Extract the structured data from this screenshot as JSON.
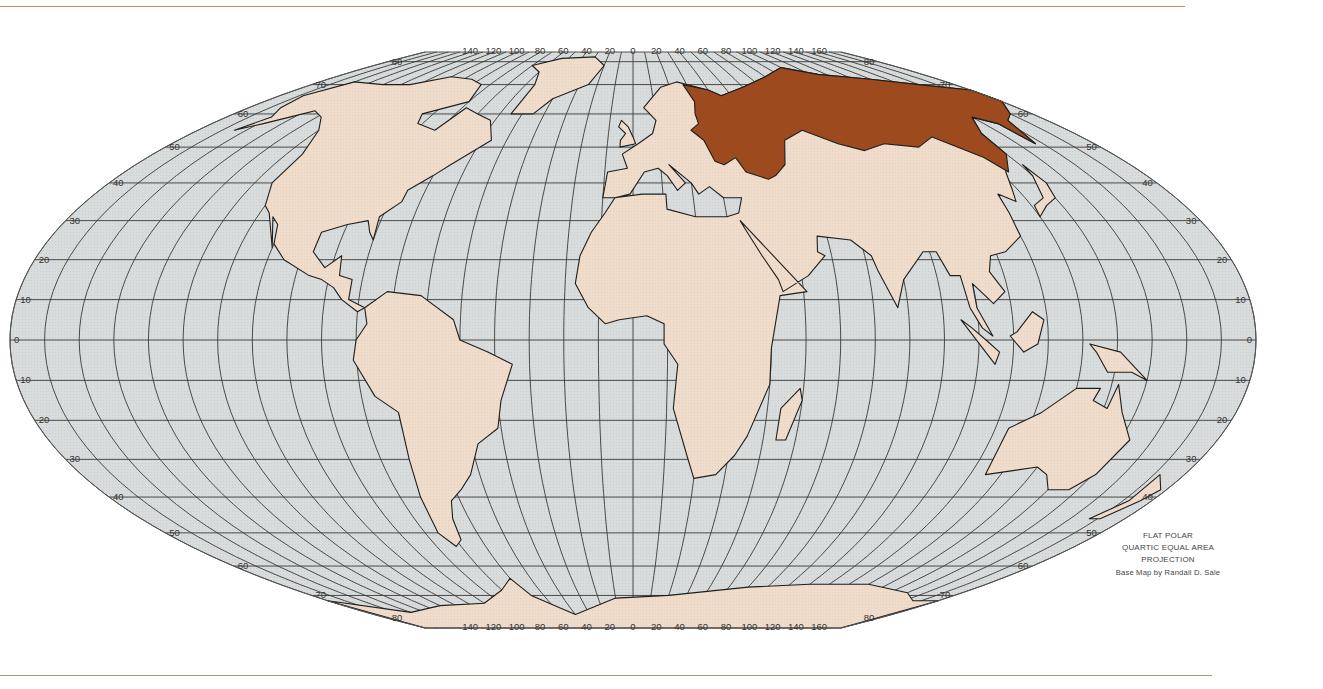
{
  "map": {
    "projection_title_lines": [
      "FLAT POLAR",
      "QUARTIC EQUAL AREA",
      "PROJECTION"
    ],
    "credit": "Base Map by Randall D. Sale",
    "highlighted_region": "Russia / Soviet Union",
    "colors": {
      "ocean": "#d9dcdc",
      "land": "#efdccb",
      "highlight": "#9c4a1e",
      "graticule": "#3a3a3a",
      "border": "#1e1e1e",
      "rule_line": "#c98a5e"
    },
    "longitude_labels_top": [
      "140",
      "120",
      "100",
      "80",
      "60",
      "40",
      "20",
      "0",
      "20",
      "40",
      "60",
      "80",
      "100",
      "120",
      "140",
      "160"
    ],
    "longitude_labels_bottom": [
      "140",
      "120",
      "100",
      "80",
      "60",
      "40",
      "20",
      "0",
      "20",
      "40",
      "60",
      "80",
      "100",
      "120",
      "140",
      "160"
    ],
    "latitude_labels_left": [
      "80",
      "70",
      "60",
      "50",
      "40",
      "30",
      "20",
      "10",
      "0",
      "10",
      "20",
      "30",
      "40",
      "50",
      "60",
      "70",
      "80"
    ],
    "latitude_labels_right": [
      "80",
      "70",
      "60",
      "50",
      "40",
      "30",
      "20",
      "10",
      "0",
      "10",
      "20",
      "30",
      "40",
      "50",
      "60",
      "70",
      "80"
    ],
    "graticule_step_degrees": 10
  }
}
